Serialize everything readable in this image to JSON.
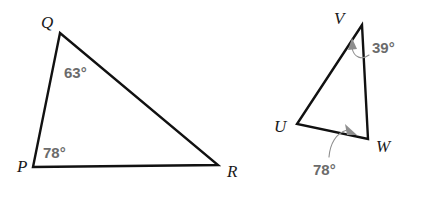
{
  "figure": {
    "background_color": "#ffffff",
    "stroke_color": "#111111",
    "label_color": "#1a1a1a",
    "angle_text_color": "#6b6b6b",
    "leader_color": "#8e8e8e"
  },
  "triangles": [
    {
      "name": "triangle-pqr",
      "vertices": [
        {
          "label": "Q",
          "x": 60,
          "y": 33,
          "label_x": 41,
          "label_y": 28
        },
        {
          "label": "P",
          "x": 33,
          "y": 167,
          "label_x": 17,
          "label_y": 172
        },
        {
          "label": "R",
          "x": 218,
          "y": 165,
          "label_x": 227,
          "label_y": 177
        }
      ],
      "path": "M 60 33 L 33 167 L 218 165 Z",
      "angles": [
        {
          "at": "Q",
          "value": "63°",
          "text_x": 64,
          "text_y": 78,
          "has_leader": false
        },
        {
          "at": "P",
          "value": "78°",
          "text_x": 43,
          "text_y": 158,
          "has_leader": false
        }
      ]
    },
    {
      "name": "triangle-uvw",
      "vertices": [
        {
          "label": "V",
          "x": 362,
          "y": 25,
          "label_x": 334,
          "label_y": 24
        },
        {
          "label": "U",
          "x": 297,
          "y": 124,
          "label_x": 274,
          "label_y": 132
        },
        {
          "label": "W",
          "x": 368,
          "y": 139,
          "label_x": 376,
          "label_y": 152
        }
      ],
      "path": "M 362 25 L 297 124 L 368 139 Z",
      "angles": [
        {
          "at": "V",
          "value": "39°",
          "text_x": 372,
          "text_y": 53,
          "has_leader": true,
          "leader_path": "M 369 55 C 362 60 354 58 352 48",
          "arrow_points": "352,38 348,50 357,49"
        },
        {
          "at": "W",
          "value": "78°",
          "text_x": 313,
          "text_y": 175,
          "has_leader": true,
          "leader_path": "M 329 157 C 330 144 336 133 347 130",
          "arrow_points": "357,135 345,124 347,135"
        }
      ]
    }
  ]
}
